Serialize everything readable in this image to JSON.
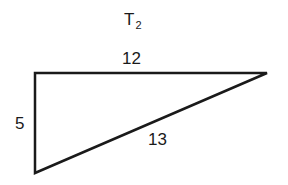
{
  "diagram": {
    "title": {
      "main": "T",
      "subscript": "2"
    },
    "shape": "right-triangle",
    "vertices": {
      "top_left": [
        35,
        73
      ],
      "top_right": [
        267,
        73
      ],
      "bottom_left": [
        35,
        173
      ]
    },
    "sides": {
      "top": "12",
      "left": "5",
      "hypotenuse": "13"
    },
    "stroke_color": "#1a1a1a",
    "background_color": "#ffffff"
  }
}
